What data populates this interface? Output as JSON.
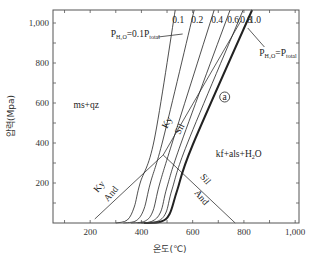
{
  "chart_data": {
    "type": "line",
    "title": "",
    "xlabel": "온도(℃)",
    "ylabel": "압력(Mpa)",
    "xlim": [
      55,
      1015
    ],
    "ylim": [
      0,
      1065
    ],
    "xticks": [
      100,
      200,
      300,
      400,
      500,
      600,
      700,
      800,
      900,
      1000
    ],
    "xtick_labels": [
      {
        "value": 200,
        "label": "200"
      },
      {
        "value": 400,
        "label": "400"
      },
      {
        "value": 600,
        "label": "600"
      },
      {
        "value": 800,
        "label": "800"
      },
      {
        "value": 1000,
        "label": "1,000"
      }
    ],
    "yticks": [
      100,
      200,
      300,
      400,
      500,
      600,
      700,
      800,
      900,
      1000
    ],
    "ytick_labels": [
      {
        "value": 200,
        "label": "200"
      },
      {
        "value": 400,
        "label": "400"
      },
      {
        "value": 600,
        "label": "600"
      },
      {
        "value": 800,
        "label": "800"
      },
      {
        "value": 1000,
        "label": "1,000"
      }
    ],
    "grid": false,
    "series": [
      {
        "name": "0.1",
        "label": "0.1",
        "bold": false,
        "points": [
          [
            300,
            0
          ],
          [
            345,
            15
          ],
          [
            372,
            80
          ],
          [
            395,
            200
          ],
          [
            450,
            415
          ],
          [
            532,
            1065
          ]
        ]
      },
      {
        "name": "0.2",
        "label": "0.2",
        "bold": false,
        "points": [
          [
            330,
            0
          ],
          [
            380,
            12
          ],
          [
            410,
            70
          ],
          [
            435,
            200
          ],
          [
            485,
            420
          ],
          [
            606,
            1065
          ]
        ]
      },
      {
        "name": "0.4",
        "label": "0.4",
        "bold": false,
        "points": [
          [
            360,
            0
          ],
          [
            415,
            10
          ],
          [
            445,
            60
          ],
          [
            470,
            190
          ],
          [
            520,
            400
          ],
          [
            684,
            1065
          ]
        ]
      },
      {
        "name": "0.6",
        "label": "0.6",
        "bold": false,
        "points": [
          [
            385,
            0
          ],
          [
            440,
            8
          ],
          [
            475,
            55
          ],
          [
            500,
            180
          ],
          [
            555,
            400
          ],
          [
            746,
            1065
          ]
        ]
      },
      {
        "name": "0.8",
        "label": "0.8",
        "bold": false,
        "points": [
          [
            400,
            0
          ],
          [
            460,
            7
          ],
          [
            495,
            50
          ],
          [
            520,
            170
          ],
          [
            580,
            400
          ],
          [
            797,
            1065
          ]
        ]
      },
      {
        "name": "1.0",
        "label": "1.0",
        "bold": true,
        "points": [
          [
            410,
            0
          ],
          [
            475,
            6
          ],
          [
            510,
            45
          ],
          [
            540,
            165
          ],
          [
            600,
            390
          ],
          [
            832,
            1065
          ]
        ]
      }
    ],
    "phase_boundaries": [
      {
        "name": "Ky-And",
        "points": [
          [
            218,
            20
          ],
          [
            485,
            340
          ]
        ]
      },
      {
        "name": "Ky-Sil",
        "points": [
          [
            485,
            340
          ],
          [
            788,
            1010
          ]
        ]
      },
      {
        "name": "And-Sil",
        "points": [
          [
            485,
            340
          ],
          [
            766,
            0
          ]
        ]
      }
    ],
    "annotations": [
      {
        "id": "ratio-label",
        "text": "P",
        "sub": "H₂O",
        "rest": "=0.1P",
        "sub2": "total",
        "at": [
          280,
          930
        ],
        "arrow_to": [
          465,
          930
        ]
      },
      {
        "id": "equal-label",
        "text": "P",
        "sub": "H₂O",
        "rest": "=P",
        "sub2": "total",
        "at": [
          860,
          835
        ],
        "arrow_from": [
          880,
          880
        ],
        "arrow_to": [
          815,
          975
        ]
      },
      {
        "id": "ms-qz",
        "text": "ms+qz",
        "at": [
          135,
          575
        ]
      },
      {
        "id": "kf-als",
        "text": "kf+als+H",
        "sub": "2",
        "rest": "O",
        "at": [
          690,
          330
        ]
      },
      {
        "id": "point-a",
        "text": "a",
        "at": [
          725,
          615
        ],
        "circled": true
      },
      {
        "id": "ky-1",
        "text": "Ky",
        "at": [
          230,
          150
        ],
        "rotate": -50
      },
      {
        "id": "and-1",
        "text": "And",
        "at": [
          270,
          105
        ],
        "rotate": -50
      },
      {
        "id": "ky-2",
        "text": "Ky",
        "at": [
          500,
          470
        ],
        "rotate": -63
      },
      {
        "id": "sil-1",
        "text": "Sil",
        "at": [
          550,
          440
        ],
        "rotate": -63
      },
      {
        "id": "sil-2",
        "text": "Sil",
        "at": [
          628,
          230
        ],
        "rotate": 50
      },
      {
        "id": "and-2",
        "text": "And",
        "at": [
          605,
          150
        ],
        "rotate": 50
      }
    ]
  }
}
